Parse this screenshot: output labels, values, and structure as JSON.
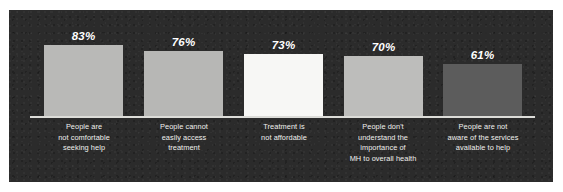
{
  "chart_data": {
    "type": "bar",
    "title": "",
    "subtitle": "",
    "xlabel": "",
    "ylabel": "",
    "ylim": [
      0,
      100
    ],
    "grid": false,
    "legend": false,
    "value_suffix": "%",
    "categories": [
      "People are not comfortable seeking help",
      "People cannot easily access treatment",
      "Treatment is not affordable",
      "People don't understand the importance of MH to overall health",
      "People are not aware of the services available to help"
    ],
    "values": [
      83,
      76,
      73,
      70,
      61
    ],
    "bars": [
      {
        "value_label": "83%",
        "value": 83,
        "color": "#b9b9b7",
        "caption_lines": [
          "People are",
          "not comfortable",
          "seeking help"
        ]
      },
      {
        "value_label": "76%",
        "value": 76,
        "color": "#b7b7b5",
        "caption_lines": [
          "People cannot",
          "easily access",
          "treatment"
        ]
      },
      {
        "value_label": "73%",
        "value": 73,
        "color": "#f7f7f5",
        "caption_lines": [
          "Treatment is",
          "not affordable"
        ]
      },
      {
        "value_label": "70%",
        "value": 70,
        "color": "#bdbdbb",
        "caption_lines": [
          "People don't",
          "understand the",
          "importance of",
          "MH to overall health"
        ]
      },
      {
        "value_label": "61%",
        "value": 61,
        "color": "#5c5c5c",
        "caption_lines": [
          "People are not",
          "aware of the services",
          "available to help"
        ]
      }
    ]
  },
  "style": {
    "panel_background": "#2b2b2b",
    "page_background": "#ffffff",
    "axis_line_color": "#dcdcd8",
    "value_text_color": "#ffffff",
    "caption_text_color": "#f0f0ee"
  }
}
